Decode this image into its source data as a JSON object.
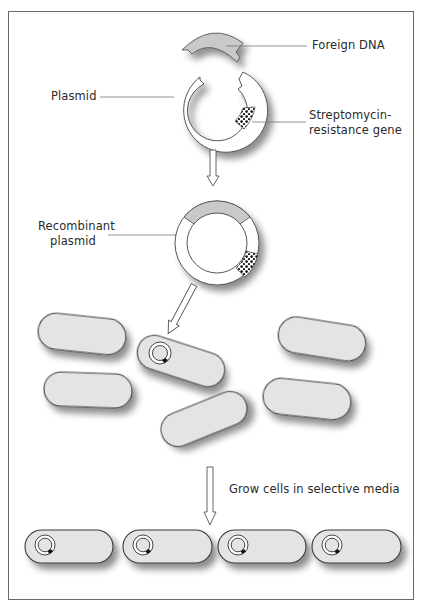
{
  "diagram": {
    "labels": {
      "foreign_dna": "Foreign DNA",
      "plasmid": "Plasmid",
      "resistance_gene_line1": "Streptomycin-",
      "resistance_gene_line2": "resistance gene",
      "recombinant_line1": "Recombinant",
      "recombinant_line2": "plasmid",
      "grow_step": "Grow cells in selective media"
    },
    "steps": [
      {
        "id": 1,
        "description": "Foreign DNA fragment and cut plasmid with streptomycin-resistance gene"
      },
      {
        "id": 2,
        "description": "Recombinant plasmid formed"
      },
      {
        "id": 3,
        "description": "Recombinant plasmid introduced into one bacterial cell among seven"
      },
      {
        "id": 4,
        "description": "Cells grown in selective media; only plasmid-carrying cells survive (4 cells shown)"
      }
    ],
    "cells_initial_count": 7,
    "cells_final_count": 4,
    "colors": {
      "border": "#6a6a6a",
      "cell_fill": "#e4e4e4",
      "cell_stroke": "#3a3a3a",
      "foreign_dna_fill": "#c9c9c9",
      "plasmid_fill": "#ffffff",
      "gene_dots": "#111111",
      "text": "#2a2a2a"
    }
  }
}
